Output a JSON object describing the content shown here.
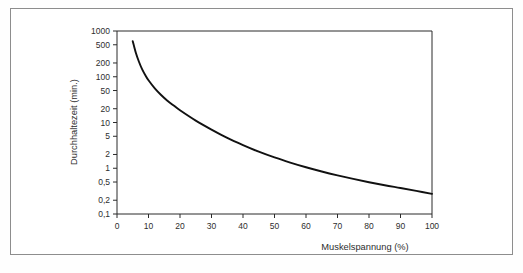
{
  "figure": {
    "background_color": "#ffffff",
    "border_color": "#8d8d8d",
    "curve_color": "#111111",
    "axis_color": "#2b2b2b",
    "text_color": "#2e2e2e"
  },
  "chart_data": {
    "type": "line",
    "title": "",
    "subtitle": "",
    "xlabel": "Muskelspannung (%)",
    "ylabel": "Durchhaltezeit (min.)",
    "xscale": "linear",
    "yscale": "log",
    "xlim": [
      0,
      100
    ],
    "ylim": [
      0.1,
      1000
    ],
    "grid": false,
    "legend": false,
    "legend_position": "none",
    "x_ticks": [
      0,
      10,
      20,
      30,
      40,
      50,
      60,
      70,
      80,
      90,
      100
    ],
    "x_tick_labels": [
      "0",
      "10",
      "20",
      "30",
      "40",
      "50",
      "60",
      "70",
      "80",
      "90",
      "100"
    ],
    "y_ticks": [
      1000,
      500,
      200,
      100,
      50,
      20,
      10,
      5,
      2,
      1,
      0.5,
      0.2,
      0.1
    ],
    "y_tick_labels": [
      "1000",
      "500",
      "200",
      "100",
      "50",
      "20",
      "10",
      "5",
      "2",
      "1",
      "0,5",
      "0,2",
      "0,1"
    ],
    "series": [
      {
        "name": "Durchhaltezeit",
        "x": [
          5,
          6,
          7,
          8,
          9,
          10,
          12,
          14,
          16,
          18,
          20,
          25,
          30,
          35,
          40,
          45,
          50,
          55,
          60,
          65,
          70,
          75,
          80,
          85,
          90,
          95,
          100
        ],
        "y": [
          600,
          330,
          210,
          145,
          108,
          84,
          56,
          40,
          30,
          23.5,
          18.5,
          11.0,
          7.0,
          4.6,
          3.2,
          2.3,
          1.72,
          1.33,
          1.05,
          0.85,
          0.7,
          0.585,
          0.495,
          0.425,
          0.37,
          0.32,
          0.275
        ]
      }
    ],
    "annotations": []
  },
  "labels": {
    "y_axis_title": "Durchhaltezeit (min.)",
    "x_axis_title": "Muskelspannung (%)"
  }
}
